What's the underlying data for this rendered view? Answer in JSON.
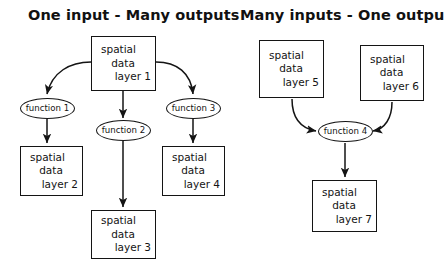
{
  "diagram": {
    "title_left": "One input - Many outputs",
    "title_right": "Many inputs - One output",
    "stroke_color": "#141414",
    "background_color": "#ffffff",
    "panels": [
      {
        "name": "one-input-many-outputs",
        "title": "One input - Many outputs",
        "nodes": {
          "source": {
            "line1": "spatial",
            "line2": "data",
            "line3": "layer 1"
          },
          "function_1": {
            "label": "function 1"
          },
          "function_2": {
            "label": "function 2"
          },
          "function_3": {
            "label": "function 3"
          },
          "output_1": {
            "line1": "spatial",
            "line2": "data",
            "line3": "layer 2"
          },
          "output_2": {
            "line1": "spatial",
            "line2": "data",
            "line3": "layer 3"
          },
          "output_3": {
            "line1": "spatial",
            "line2": "data",
            "line3": "layer 4"
          }
        }
      },
      {
        "name": "many-inputs-one-output",
        "title": "Many inputs - One output",
        "nodes": {
          "input_1": {
            "line1": "spatial",
            "line2": "data",
            "line3": "layer 5"
          },
          "input_2": {
            "line1": "spatial",
            "line2": "data",
            "line3": "layer 6"
          },
          "function_4": {
            "label": "function 4"
          },
          "output": {
            "line1": "spatial",
            "line2": "data",
            "line3": "layer 7"
          }
        }
      }
    ],
    "edges": [
      {
        "name": "edge-layer1-to-function1",
        "from": "spatial data layer 1",
        "to": "function 1",
        "style": "curved-arrow"
      },
      {
        "name": "edge-layer1-to-function2",
        "from": "spatial data layer 1",
        "to": "function 2",
        "style": "straight-arrow"
      },
      {
        "name": "edge-layer1-to-function3",
        "from": "spatial data layer 1",
        "to": "function 3",
        "style": "curved-arrow"
      },
      {
        "name": "edge-function1-to-layer2",
        "from": "function 1",
        "to": "spatial data layer 2",
        "style": "straight-arrow"
      },
      {
        "name": "edge-function2-to-layer3",
        "from": "function 2",
        "to": "spatial data layer 3",
        "style": "straight-arrow"
      },
      {
        "name": "edge-function3-to-layer4",
        "from": "function 3",
        "to": "spatial data layer 4",
        "style": "straight-arrow"
      },
      {
        "name": "edge-layer5-to-function4",
        "from": "spatial data layer 5",
        "to": "function 4",
        "style": "curved-arrow"
      },
      {
        "name": "edge-layer6-to-function4",
        "from": "spatial data layer 6",
        "to": "function 4",
        "style": "curved-arrow"
      },
      {
        "name": "edge-function4-to-layer7",
        "from": "function 4",
        "to": "spatial data layer 7",
        "style": "straight-arrow"
      }
    ]
  }
}
